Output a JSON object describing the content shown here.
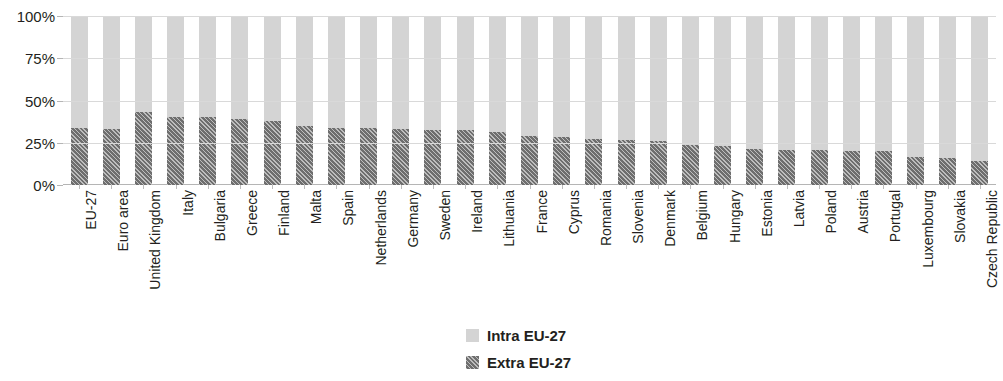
{
  "chart_data": {
    "type": "bar",
    "subtype": "stacked-100-percent",
    "title": "",
    "subtitle": "",
    "xlabel": "",
    "ylabel": "",
    "ylim": [
      0,
      100
    ],
    "ytick_labels": [
      "0%",
      "25%",
      "50%",
      "75%",
      "100%"
    ],
    "ytick_values": [
      0,
      25,
      50,
      75,
      100
    ],
    "grid": true,
    "legend_position": "bottom",
    "categories": [
      "EU-27",
      "Euro area",
      "United Kingdom",
      "Italy",
      "Bulgaria",
      "Greece",
      "Finland",
      "Malta",
      "Spain",
      "Netherlands",
      "Germany",
      "Sweden",
      "Ireland",
      "Lithuania",
      "France",
      "Cyprus",
      "Romania",
      "Slovenia",
      "Denmark",
      "Belgium",
      "Hungary",
      "Estonia",
      "Latvia",
      "Poland",
      "Austria",
      "Portugal",
      "Luxembourg",
      "Slovakia",
      "Czech Republic"
    ],
    "series": [
      {
        "name": "Extra EU-27",
        "color": "#6e6e6e",
        "pattern": "diagonal-hatch",
        "values": [
          33.5,
          33.0,
          43.0,
          40.5,
          40.0,
          39.0,
          38.0,
          35.0,
          33.5,
          33.5,
          33.0,
          32.5,
          32.5,
          31.5,
          29.0,
          28.5,
          27.0,
          26.5,
          26.0,
          23.5,
          23.0,
          21.5,
          21.0,
          20.5,
          20.0,
          20.0,
          16.5,
          16.0,
          14.0
        ]
      },
      {
        "name": "Intra EU-27",
        "color": "#d4d4d4",
        "pattern": "solid",
        "values": [
          66.5,
          67.0,
          57.0,
          59.5,
          60.0,
          61.0,
          62.0,
          65.0,
          66.5,
          66.5,
          67.0,
          67.5,
          67.5,
          68.5,
          71.0,
          71.5,
          73.0,
          73.5,
          74.0,
          76.5,
          77.0,
          78.5,
          79.0,
          79.5,
          80.0,
          80.0,
          83.5,
          84.0,
          86.0
        ]
      }
    ]
  },
  "legend": {
    "entries": [
      {
        "label": "Intra EU-27",
        "swatch": "light-gray-solid"
      },
      {
        "label": "Extra EU-27",
        "swatch": "dark-gray-hatched"
      }
    ]
  },
  "colors": {
    "intra": "#d4d4d4",
    "extra": "#6e6e6e",
    "gridline": "#d9d9d9",
    "axis": "#b5b5b5",
    "text": "#231f20",
    "background": "#ffffff"
  }
}
